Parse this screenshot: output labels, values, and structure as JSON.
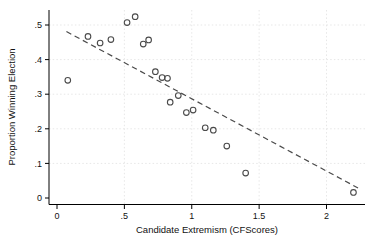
{
  "chart_data": {
    "type": "scatter",
    "title": "",
    "xlabel": "Candidate Extremism (CFScores)",
    "ylabel": "Proportion Winning Election",
    "xlim": [
      0,
      2.3
    ],
    "ylim": [
      0,
      0.55
    ],
    "grid": true,
    "legend_position": "none",
    "x_ticks": {
      "values": [
        0,
        0.5,
        1,
        1.5,
        2
      ],
      "labels": [
        "0",
        ".5",
        "1",
        "1.5",
        "2"
      ]
    },
    "y_ticks": {
      "values": [
        0,
        0.1,
        0.2,
        0.3,
        0.4,
        0.5
      ],
      "labels": [
        "0",
        ".1",
        ".2",
        ".3",
        ".4",
        ".5"
      ]
    },
    "points": [
      [
        0.08,
        0.34
      ],
      [
        0.23,
        0.467
      ],
      [
        0.32,
        0.448
      ],
      [
        0.4,
        0.458
      ],
      [
        0.52,
        0.507
      ],
      [
        0.58,
        0.524
      ],
      [
        0.64,
        0.445
      ],
      [
        0.68,
        0.457
      ],
      [
        0.73,
        0.365
      ],
      [
        0.78,
        0.348
      ],
      [
        0.82,
        0.346
      ],
      [
        0.84,
        0.277
      ],
      [
        0.9,
        0.296
      ],
      [
        0.96,
        0.247
      ],
      [
        1.01,
        0.254
      ],
      [
        1.1,
        0.203
      ],
      [
        1.16,
        0.196
      ],
      [
        1.26,
        0.15
      ],
      [
        1.4,
        0.072
      ],
      [
        2.2,
        0.016
      ]
    ],
    "trend_line": {
      "style": "dashed",
      "x1": 0.07,
      "y1": 0.481,
      "x2": 2.234,
      "y2": 0.029
    },
    "colors": {
      "marker": "#4a4a4a",
      "trend": "#4a4a4a",
      "axis": "#000000",
      "grid": "#e7e7e7",
      "text": "#111111",
      "background": "#ffffff"
    }
  }
}
